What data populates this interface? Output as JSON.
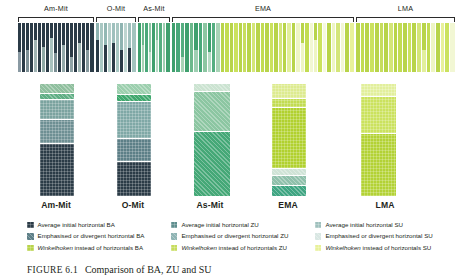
{
  "figure": {
    "number_label": "FIGURE 6.1",
    "caption": "Comparison of BA, ZU and SU"
  },
  "groups": [
    {
      "key": "am-mit",
      "label": "Am-Mit",
      "x": 18,
      "width": 76
    },
    {
      "key": "o-mit",
      "label": "O-Mit",
      "x": 96,
      "width": 40
    },
    {
      "key": "as-mit",
      "label": "As-Mit",
      "x": 138,
      "width": 32
    },
    {
      "key": "ema",
      "label": "EMA",
      "x": 172,
      "width": 182
    },
    {
      "key": "lma",
      "label": "LMA",
      "x": 356,
      "width": 99
    }
  ],
  "column_labels": [
    {
      "label": "Am-Mit",
      "x": 18,
      "width": 76
    },
    {
      "label": "O-Mit",
      "x": 96,
      "width": 74
    },
    {
      "label": "As-Mit",
      "x": 172,
      "width": 76
    },
    {
      "label": "EMA",
      "x": 250,
      "width": 76
    },
    {
      "label": "LMA",
      "x": 340,
      "width": 90
    }
  ],
  "colors": {
    "ba_average": "#2b3b47",
    "ba_emphasised": "#5d7f87",
    "ba_winkelhoken": "#b8d44a",
    "zu_average": "#5f8e8e",
    "zu_emphasised": "#8fb4b4",
    "zu_winkelhoken": "#c7dd5e",
    "su_average": "#9fc0bd",
    "su_emphasised": "#d9e7e3",
    "su_winkelhoken": "#e8f19a",
    "dark_navy": "#2b3b47",
    "slate": "#5d7f87",
    "teal": "#7ba39f",
    "teal_light": "#a9c8c3",
    "green": "#3fa06e",
    "green_mid": "#6cb98c",
    "green_light": "#a8d3b6",
    "yellow_green": "#b8d44a",
    "yellow_green_light": "#d4e679",
    "cream": "#eef5c4",
    "bracket_stroke": "#2b2b2b",
    "text": "#231f20"
  },
  "legend": {
    "rows": [
      [
        {
          "label": "Average initial horizontal BA",
          "swatch": "ba_average",
          "icon": "legend-swatch",
          "italic_prefix": null
        },
        {
          "label": "Average initial horizontal ZU",
          "swatch": "zu_average",
          "icon": "legend-swatch",
          "italic_prefix": null
        },
        {
          "label": "Average initial horizontal SU",
          "swatch": "su_average",
          "icon": "legend-swatch",
          "italic_prefix": null
        }
      ],
      [
        {
          "label": "Emphasised or divergent horizontal BA",
          "swatch": "ba_emphasised",
          "icon": "legend-swatch",
          "italic_prefix": null
        },
        {
          "label": "Emphasised or divergent horizontal ZU",
          "swatch": "zu_emphasised",
          "icon": "legend-swatch",
          "italic_prefix": null
        },
        {
          "label": "Emphasised or divergent horizontal SU",
          "swatch": "su_emphasised",
          "icon": "legend-swatch",
          "italic_prefix": null
        }
      ],
      [
        {
          "label": "instead of horizontals BA",
          "swatch": "ba_winkelhoken",
          "icon": "legend-swatch",
          "italic_prefix": "Winkelhoken"
        },
        {
          "label": "instead of horizontals ZU",
          "swatch": "zu_winkelhoken",
          "icon": "legend-swatch",
          "italic_prefix": "Winkelhoken"
        },
        {
          "label": "instead of horizontals SU",
          "swatch": "su_winkelhoken",
          "icon": "legend-swatch",
          "italic_prefix": "Winkelhoken"
        }
      ]
    ]
  },
  "chart_data": {
    "type": "bar",
    "title": "Comparison of BA, ZU and SU",
    "subtype": "stacked-column proportional bars",
    "xlabel": "",
    "ylabel": "",
    "ylim": [
      0,
      100
    ],
    "grid": false,
    "legend_position": "bottom",
    "categories": [
      "Am-Mit",
      "O-Mit",
      "As-Mit",
      "EMA",
      "LMA"
    ],
    "series": [
      {
        "name": "Average initial horizontal BA",
        "color_key": "ba_average"
      },
      {
        "name": "Emphasised or divergent horizontal BA",
        "color_key": "ba_emphasised"
      },
      {
        "name": "Winkelhoken instead of horizontals BA",
        "color_key": "ba_winkelhoken"
      },
      {
        "name": "Average initial horizontal ZU",
        "color_key": "zu_average"
      },
      {
        "name": "Emphasised or divergent horizontal ZU",
        "color_key": "zu_emphasised"
      },
      {
        "name": "Winkelhoken instead of horizontals ZU",
        "color_key": "zu_winkelhoken"
      },
      {
        "name": "Average initial horizontal SU",
        "color_key": "su_average"
      },
      {
        "name": "Emphasised or divergent horizontal SU",
        "color_key": "su_emphasised"
      },
      {
        "name": "Winkelhoken instead of horizontals SU",
        "color_key": "su_winkelhoken"
      }
    ],
    "summary_columns": [
      {
        "category": "Am-Mit",
        "x": 40,
        "width": 34,
        "segments": [
          {
            "value": 9,
            "color": "#8fbf9e",
            "hatch": "diag"
          },
          {
            "value": 5,
            "color": "#5fae84",
            "hatch": "diag"
          },
          {
            "value": 18,
            "color": "#7ba39f",
            "hatch": "cross"
          },
          {
            "value": 22,
            "color": "#6e8f93",
            "hatch": "cross"
          },
          {
            "value": 46,
            "color": "#2b3b47",
            "hatch": "cross"
          }
        ]
      },
      {
        "category": "O-Mit",
        "x": 117,
        "width": 34,
        "segments": [
          {
            "value": 10,
            "color": "#9ccfae",
            "hatch": "diag"
          },
          {
            "value": 6,
            "color": "#3fa86e",
            "hatch": "diag"
          },
          {
            "value": 33,
            "color": "#7fa8a6",
            "hatch": "cross"
          },
          {
            "value": 21,
            "color": "#5d7f87",
            "hatch": "cross"
          },
          {
            "value": 30,
            "color": "#2b3b47",
            "hatch": "cross"
          }
        ]
      },
      {
        "category": "As-Mit",
        "x": 194,
        "width": 36,
        "segments": [
          {
            "value": 7,
            "color": "#cbe3d1",
            "hatch": "diag"
          },
          {
            "value": 36,
            "color": "#8cc6a2",
            "hatch": "diag"
          },
          {
            "value": 57,
            "color": "#45a877",
            "hatch": "diag"
          }
        ]
      },
      {
        "category": "EMA",
        "x": 272,
        "width": 34,
        "segments": [
          {
            "value": 13,
            "color": "#ddeb8f",
            "hatch": "cross"
          },
          {
            "value": 8,
            "color": "#c2dc52",
            "hatch": "cross"
          },
          {
            "value": 55,
            "color": "#b1d12f",
            "hatch": "cross"
          },
          {
            "value": 6,
            "color": "#cfe3d6",
            "hatch": "diag"
          },
          {
            "value": 9,
            "color": "#8fc0ab",
            "hatch": "diag"
          },
          {
            "value": 9,
            "color": "#3fa582",
            "hatch": "diag"
          }
        ]
      },
      {
        "category": "LMA",
        "x": 361,
        "width": 35,
        "segments": [
          {
            "value": 12,
            "color": "#e2ef9c",
            "hatch": "cross"
          },
          {
            "value": 33,
            "color": "#cbe25e",
            "hatch": "cross"
          },
          {
            "value": 55,
            "color": "#b3d235",
            "hatch": "cross"
          }
        ]
      }
    ],
    "bars": {
      "am-mit": [
        [
          60,
          "#2b3b47"
        ],
        [
          40,
          "#8a9aa3"
        ],
        [
          100,
          "#2b3b47"
        ],
        [
          55,
          "#2b3b47"
        ],
        [
          45,
          "#7e9096"
        ],
        [
          100,
          "#2b3b47"
        ],
        [
          35,
          "#2b3b47"
        ],
        [
          65,
          "#9fb3b3"
        ],
        [
          100,
          "#2b3b47"
        ],
        [
          48,
          "#2b3b47"
        ],
        [
          52,
          "#8fa8a5"
        ],
        [
          100,
          "#2b3b47"
        ],
        [
          30,
          "#2b3b47"
        ],
        [
          70,
          "#a9c2be"
        ],
        [
          62,
          "#2b3b47"
        ],
        [
          38,
          "#7b8f94"
        ],
        [
          100,
          "#2b3b47"
        ],
        [
          45,
          "#2b3b47"
        ],
        [
          55,
          "#93a8a9"
        ],
        [
          100,
          "#2b3b47"
        ],
        [
          70,
          "#2b3b47"
        ],
        [
          30,
          "#8fa3a6"
        ],
        [
          100,
          "#2b3b47"
        ],
        [
          40,
          "#2b3b47"
        ],
        [
          60,
          "#a2b8b5"
        ],
        [
          100,
          "#2b3b47"
        ],
        [
          55,
          "#2b3b47"
        ],
        [
          45,
          "#86999d"
        ],
        [
          100,
          "#2b3b47"
        ]
      ],
      "o-mit": [
        [
          35,
          "#8fb4b1"
        ],
        [
          65,
          "#2b3b47"
        ],
        [
          100,
          "#a9c8c3"
        ],
        [
          45,
          "#93b8b4"
        ],
        [
          55,
          "#2b3b47"
        ],
        [
          100,
          "#b5d0cb"
        ],
        [
          40,
          "#9fc0bd"
        ],
        [
          60,
          "#2b3b47"
        ],
        [
          100,
          "#a9c8c3"
        ],
        [
          55,
          "#8fb4b1"
        ],
        [
          45,
          "#2b3b47"
        ],
        [
          100,
          "#bdd5d0"
        ],
        [
          50,
          "#9fc0bd"
        ],
        [
          50,
          "#2b3b47"
        ],
        [
          100,
          "#a3c4bf"
        ]
      ],
      "as-mit": [
        [
          100,
          "#3fa06e"
        ],
        [
          45,
          "#6cb98c"
        ],
        [
          55,
          "#a8d3b6"
        ],
        [
          100,
          "#4aa87a"
        ],
        [
          60,
          "#8cc6a2"
        ],
        [
          40,
          "#c3e0cd"
        ],
        [
          100,
          "#3fa06e"
        ],
        [
          35,
          "#7bc096"
        ],
        [
          65,
          "#b5dbc4"
        ],
        [
          100,
          "#55ae80"
        ],
        [
          100,
          "#9ecfb2"
        ],
        [
          100,
          "#3fa06e"
        ]
      ],
      "ema": [
        [
          100,
          "#3fa06e"
        ],
        [
          100,
          "#4aa87a"
        ],
        [
          70,
          "#55ae80"
        ],
        [
          30,
          "#a8d3b6"
        ],
        [
          100,
          "#3fa06e"
        ],
        [
          100,
          "#6cb98c"
        ],
        [
          55,
          "#3fa06e"
        ],
        [
          45,
          "#9ecfb2"
        ],
        [
          100,
          "#4aa87a"
        ],
        [
          100,
          "#8cc6a2"
        ],
        [
          60,
          "#3fa06e"
        ],
        [
          40,
          "#b5dbc4"
        ],
        [
          100,
          "#55ae80"
        ],
        [
          100,
          "#a8d3b6"
        ],
        [
          100,
          "#b8d44a"
        ],
        [
          100,
          "#c2dc52"
        ],
        [
          100,
          "#b8d44a"
        ],
        [
          100,
          "#cbe25e"
        ],
        [
          100,
          "#b8d44a"
        ],
        [
          100,
          "#c7dd5e"
        ],
        [
          100,
          "#b8d44a"
        ],
        [
          100,
          "#d4e679"
        ],
        [
          100,
          "#b8d44a"
        ],
        [
          100,
          "#c2dc52"
        ],
        [
          100,
          "#b8d44a"
        ],
        [
          100,
          "#cbe25e"
        ],
        [
          100,
          "#b8d44a"
        ],
        [
          100,
          "#d4e679"
        ],
        [
          100,
          "#b8d44a"
        ],
        [
          100,
          "#e2ef9c"
        ],
        [
          100,
          "#b8d44a"
        ],
        [
          100,
          "#eef5c4"
        ],
        [
          40,
          "#b8d44a"
        ],
        [
          60,
          "#eef5c4"
        ],
        [
          100,
          "#c2dc52"
        ],
        [
          100,
          "#f2f7d4"
        ],
        [
          35,
          "#b8d44a"
        ],
        [
          65,
          "#eef5c4"
        ],
        [
          100,
          "#cbe25e"
        ],
        [
          100,
          "#f5f9df"
        ],
        [
          100,
          "#b8d44a"
        ],
        [
          100,
          "#eef5c4"
        ],
        [
          100,
          "#d4e679"
        ],
        [
          100,
          "#f2f7d4"
        ],
        [
          100,
          "#b8d44a"
        ],
        [
          100,
          "#e8f19a"
        ]
      ],
      "lma": [
        [
          100,
          "#b8d44a"
        ],
        [
          100,
          "#c2dc52"
        ],
        [
          100,
          "#b8d44a"
        ],
        [
          100,
          "#cbe25e"
        ],
        [
          100,
          "#b8d44a"
        ],
        [
          100,
          "#c7dd5e"
        ],
        [
          100,
          "#b8d44a"
        ],
        [
          100,
          "#d4e679"
        ],
        [
          100,
          "#b8d44a"
        ],
        [
          100,
          "#c2dc52"
        ],
        [
          100,
          "#b8d44a"
        ],
        [
          100,
          "#cbe25e"
        ],
        [
          100,
          "#b8d44a"
        ],
        [
          100,
          "#d4e679"
        ],
        [
          55,
          "#b8d44a"
        ],
        [
          45,
          "#e2ef9c"
        ],
        [
          100,
          "#c2dc52"
        ],
        [
          100,
          "#eef5c4"
        ],
        [
          100,
          "#b8d44a"
        ],
        [
          100,
          "#e8f19a"
        ],
        [
          100,
          "#cbe25e"
        ],
        [
          100,
          "#f2f7d4"
        ]
      ]
    }
  }
}
